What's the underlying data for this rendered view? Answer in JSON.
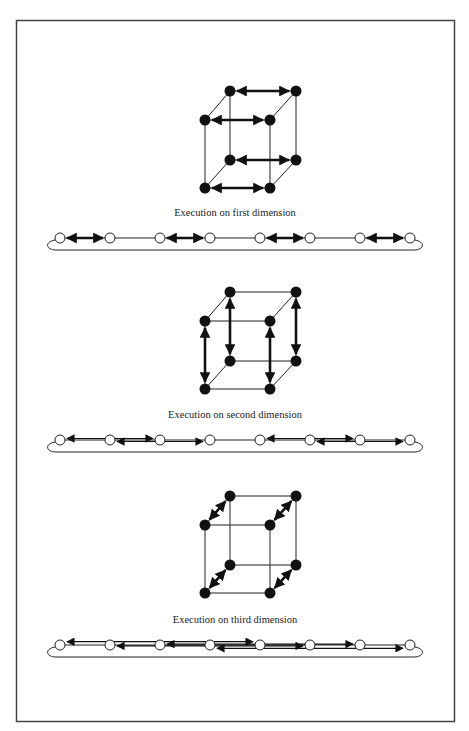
{
  "figure": {
    "border_color": "#444444",
    "ink_color": "#111111",
    "panels": [
      {
        "id": "first",
        "caption": "Execution on first dimension",
        "cube": {
          "origin_y": 91,
          "exchange_axis": "horizontal",
          "exchanges": [
            [
              "btl",
              "btr"
            ],
            [
              "ftl",
              "ftr"
            ],
            [
              "bbl",
              "bbr"
            ],
            [
              "fbl",
              "fbr"
            ]
          ]
        },
        "ring": {
          "y": 238,
          "nodes": [
            60,
            110,
            160,
            210,
            260,
            310,
            360,
            410
          ],
          "arrows": [
            [
              60,
              110
            ],
            [
              160,
              210
            ],
            [
              260,
              310
            ],
            [
              360,
              410
            ]
          ]
        }
      },
      {
        "id": "second",
        "caption": "Execution on second dimension",
        "cube": {
          "origin_y": 292,
          "exchange_axis": "vertical",
          "exchanges": [
            [
              "btl",
              "bbl"
            ],
            [
              "ftl",
              "fbl"
            ],
            [
              "btr",
              "bbr"
            ],
            [
              "ftr",
              "fbr"
            ]
          ]
        },
        "ring": {
          "y": 440,
          "nodes": [
            60,
            110,
            160,
            210,
            260,
            310,
            360,
            410
          ],
          "arrows": [
            [
              60,
              160
            ],
            [
              110,
              210
            ],
            [
              260,
              360
            ],
            [
              310,
              410
            ]
          ]
        }
      },
      {
        "id": "third",
        "caption": "Execution on third dimension",
        "cube": {
          "origin_y": 496,
          "exchange_axis": "depth",
          "exchanges": [
            [
              "btl",
              "ftl"
            ],
            [
              "btr",
              "ftr"
            ],
            [
              "bbl",
              "fbl"
            ],
            [
              "bbr",
              "fbr"
            ]
          ]
        },
        "ring": {
          "y": 645,
          "nodes": [
            60,
            110,
            160,
            210,
            260,
            310,
            360,
            410
          ],
          "arrows": [
            [
              60,
              260
            ],
            [
              110,
              310
            ],
            [
              160,
              360
            ],
            [
              210,
              410
            ]
          ]
        }
      }
    ]
  }
}
